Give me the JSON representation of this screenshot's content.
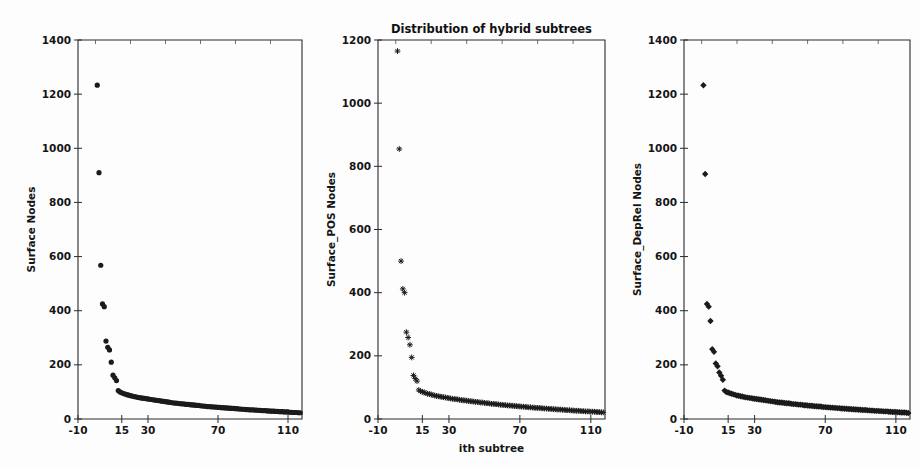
{
  "figure": {
    "title": "Distribution of hybrid subtrees",
    "background_color": "#fdfdfd",
    "marker_color": "#1b1b1b",
    "width": 920,
    "height": 468,
    "panel_count": 3
  },
  "chart_data": [
    {
      "type": "scatter",
      "title": "",
      "xlabel": "",
      "ylabel": "Surface Nodes",
      "marker": "circle",
      "grid": false,
      "legend": null,
      "xlim": [
        -10,
        118
      ],
      "ylim": [
        0,
        1400
      ],
      "xticks": [
        -10,
        15,
        30,
        70,
        110
      ],
      "xticklabels": [
        "-10",
        "15",
        "30",
        "70",
        "110"
      ],
      "yticks": [
        0,
        200,
        400,
        600,
        800,
        1000,
        1200,
        1400
      ],
      "yticklabels": [
        "0",
        "200",
        "400",
        "600",
        "800",
        "1000",
        "1200",
        "1400"
      ],
      "x": [
        1,
        2,
        3,
        4,
        5,
        6,
        7,
        8,
        9,
        10,
        11,
        12,
        13,
        14,
        15,
        16,
        17,
        18,
        19,
        20,
        21,
        22,
        23,
        24,
        25,
        26,
        27,
        28,
        29,
        30,
        31,
        32,
        33,
        34,
        35,
        36,
        37,
        38,
        39,
        40,
        41,
        42,
        43,
        44,
        45,
        46,
        47,
        48,
        49,
        50,
        51,
        52,
        53,
        54,
        55,
        56,
        57,
        58,
        59,
        60,
        61,
        62,
        63,
        64,
        65,
        66,
        67,
        68,
        69,
        70,
        71,
        72,
        73,
        74,
        75,
        76,
        77,
        78,
        79,
        80,
        81,
        82,
        83,
        84,
        85,
        86,
        87,
        88,
        89,
        90,
        91,
        92,
        93,
        94,
        95,
        96,
        97,
        98,
        99,
        100,
        101,
        102,
        103,
        104,
        105,
        106,
        107,
        108,
        109,
        110,
        111,
        112,
        113,
        114,
        115,
        116,
        117
      ],
      "y": [
        1233,
        910,
        568,
        425,
        415,
        288,
        265,
        255,
        210,
        162,
        152,
        142,
        105,
        100,
        97,
        94,
        92,
        90,
        88,
        86,
        85,
        83,
        82,
        80,
        79,
        78,
        77,
        76,
        75,
        74,
        73,
        72,
        71,
        70,
        69,
        68,
        67,
        66,
        65,
        64,
        63,
        62,
        61,
        60,
        59,
        59,
        58,
        57,
        56,
        56,
        55,
        54,
        54,
        53,
        52,
        52,
        51,
        50,
        50,
        49,
        48,
        48,
        47,
        46,
        46,
        45,
        45,
        44,
        44,
        43,
        43,
        42,
        42,
        41,
        41,
        40,
        40,
        39,
        39,
        38,
        38,
        37,
        37,
        36,
        36,
        35,
        35,
        34,
        34,
        34,
        33,
        33,
        32,
        32,
        31,
        31,
        31,
        30,
        30,
        29,
        29,
        29,
        28,
        28,
        27,
        27,
        27,
        26,
        26,
        26,
        25,
        25,
        24,
        24,
        24,
        23,
        23
      ]
    },
    {
      "type": "scatter",
      "title": "Distribution of hybrid subtrees",
      "xlabel": "ith subtree",
      "ylabel": "Surface_POS Nodes",
      "marker": "star",
      "grid": false,
      "legend": null,
      "xlim": [
        -10,
        118
      ],
      "ylim": [
        0,
        1200
      ],
      "xticks": [
        -10,
        15,
        30,
        70,
        110
      ],
      "xticklabels": [
        "-10",
        "15",
        "30",
        "70",
        "110"
      ],
      "yticks": [
        0,
        200,
        400,
        600,
        800,
        1000,
        1200
      ],
      "yticklabels": [
        "0",
        "200",
        "400",
        "600",
        "800",
        "1000",
        "1200"
      ],
      "x": [
        1,
        2,
        3,
        4,
        5,
        6,
        7,
        8,
        9,
        10,
        11,
        12,
        13,
        14,
        15,
        16,
        17,
        18,
        19,
        20,
        21,
        22,
        23,
        24,
        25,
        26,
        27,
        28,
        29,
        30,
        31,
        32,
        33,
        34,
        35,
        36,
        37,
        38,
        39,
        40,
        41,
        42,
        43,
        44,
        45,
        46,
        47,
        48,
        49,
        50,
        51,
        52,
        53,
        54,
        55,
        56,
        57,
        58,
        59,
        60,
        61,
        62,
        63,
        64,
        65,
        66,
        67,
        68,
        69,
        70,
        71,
        72,
        73,
        74,
        75,
        76,
        77,
        78,
        79,
        80,
        81,
        82,
        83,
        84,
        85,
        86,
        87,
        88,
        89,
        90,
        91,
        92,
        93,
        94,
        95,
        96,
        97,
        98,
        99,
        100,
        101,
        102,
        103,
        104,
        105,
        106,
        107,
        108,
        109,
        110,
        111,
        112,
        113,
        114,
        115,
        116,
        117
      ],
      "y": [
        1165,
        855,
        500,
        412,
        400,
        275,
        258,
        235,
        195,
        138,
        128,
        120,
        92,
        88,
        86,
        84,
        82,
        80,
        79,
        77,
        76,
        74,
        73,
        72,
        71,
        70,
        69,
        68,
        67,
        66,
        65,
        64,
        63,
        63,
        62,
        61,
        60,
        59,
        59,
        58,
        57,
        56,
        56,
        55,
        54,
        54,
        53,
        52,
        52,
        51,
        50,
        50,
        49,
        48,
        48,
        47,
        47,
        46,
        45,
        45,
        44,
        44,
        43,
        43,
        42,
        42,
        41,
        41,
        40,
        40,
        39,
        39,
        38,
        38,
        37,
        37,
        36,
        36,
        35,
        35,
        35,
        34,
        34,
        33,
        33,
        32,
        32,
        32,
        31,
        31,
        30,
        30,
        30,
        29,
        29,
        28,
        28,
        28,
        27,
        27,
        26,
        26,
        26,
        25,
        25,
        25,
        24,
        24,
        24,
        23,
        23,
        23,
        22,
        22,
        22,
        21,
        21
      ]
    },
    {
      "type": "scatter",
      "title": "",
      "xlabel": "",
      "ylabel": "Surface_DepRel Nodes",
      "marker": "diamond",
      "grid": false,
      "legend": null,
      "xlim": [
        -10,
        118
      ],
      "ylim": [
        0,
        1400
      ],
      "xticks": [
        -10,
        15,
        30,
        70,
        110
      ],
      "xticklabels": [
        "-10",
        "15",
        "30",
        "70",
        "110"
      ],
      "yticks": [
        0,
        200,
        400,
        600,
        800,
        1000,
        1200,
        1400
      ],
      "yticklabels": [
        "0",
        "200",
        "400",
        "600",
        "800",
        "1000",
        "1200",
        "1400"
      ],
      "x": [
        1,
        2,
        3,
        4,
        5,
        6,
        7,
        8,
        9,
        10,
        11,
        12,
        13,
        14,
        15,
        16,
        17,
        18,
        19,
        20,
        21,
        22,
        23,
        24,
        25,
        26,
        27,
        28,
        29,
        30,
        31,
        32,
        33,
        34,
        35,
        36,
        37,
        38,
        39,
        40,
        41,
        42,
        43,
        44,
        45,
        46,
        47,
        48,
        49,
        50,
        51,
        52,
        53,
        54,
        55,
        56,
        57,
        58,
        59,
        60,
        61,
        62,
        63,
        64,
        65,
        66,
        67,
        68,
        69,
        70,
        71,
        72,
        73,
        74,
        75,
        76,
        77,
        78,
        79,
        80,
        81,
        82,
        83,
        84,
        85,
        86,
        87,
        88,
        89,
        90,
        91,
        92,
        93,
        94,
        95,
        96,
        97,
        98,
        99,
        100,
        101,
        102,
        103,
        104,
        105,
        106,
        107,
        108,
        109,
        110,
        111,
        112,
        113,
        114,
        115,
        116,
        117
      ],
      "y": [
        1233,
        905,
        425,
        415,
        362,
        258,
        248,
        205,
        195,
        172,
        160,
        145,
        105,
        100,
        98,
        95,
        93,
        91,
        89,
        87,
        86,
        84,
        83,
        81,
        80,
        79,
        78,
        77,
        76,
        75,
        74,
        73,
        72,
        71,
        70,
        69,
        68,
        67,
        66,
        65,
        64,
        63,
        62,
        61,
        61,
        60,
        59,
        58,
        58,
        57,
        56,
        55,
        55,
        54,
        53,
        53,
        52,
        51,
        51,
        50,
        49,
        49,
        48,
        47,
        47,
        46,
        46,
        45,
        44,
        44,
        43,
        43,
        42,
        42,
        41,
        41,
        40,
        40,
        39,
        39,
        38,
        38,
        37,
        37,
        36,
        36,
        35,
        35,
        34,
        34,
        33,
        33,
        33,
        32,
        32,
        31,
        31,
        30,
        30,
        30,
        29,
        29,
        28,
        28,
        28,
        27,
        27,
        26,
        26,
        26,
        25,
        25,
        24,
        24,
        24,
        23,
        22
      ]
    }
  ]
}
